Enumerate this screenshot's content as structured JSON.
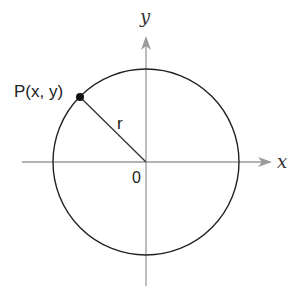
{
  "diagram": {
    "type": "unit-circle-point",
    "colors": {
      "axis": "#9a9a9a",
      "circle": "#222222",
      "radius_line": "#333333",
      "point": "#111111",
      "background": "#ffffff"
    },
    "axes": {
      "x_label": "x",
      "y_label": "y",
      "origin_label": "0"
    },
    "circle": {
      "center": [
        146,
        162
      ],
      "radius": 93
    },
    "point": {
      "label": "P(x, y)",
      "position": [
        80,
        97
      ]
    },
    "radius_label": "r"
  }
}
